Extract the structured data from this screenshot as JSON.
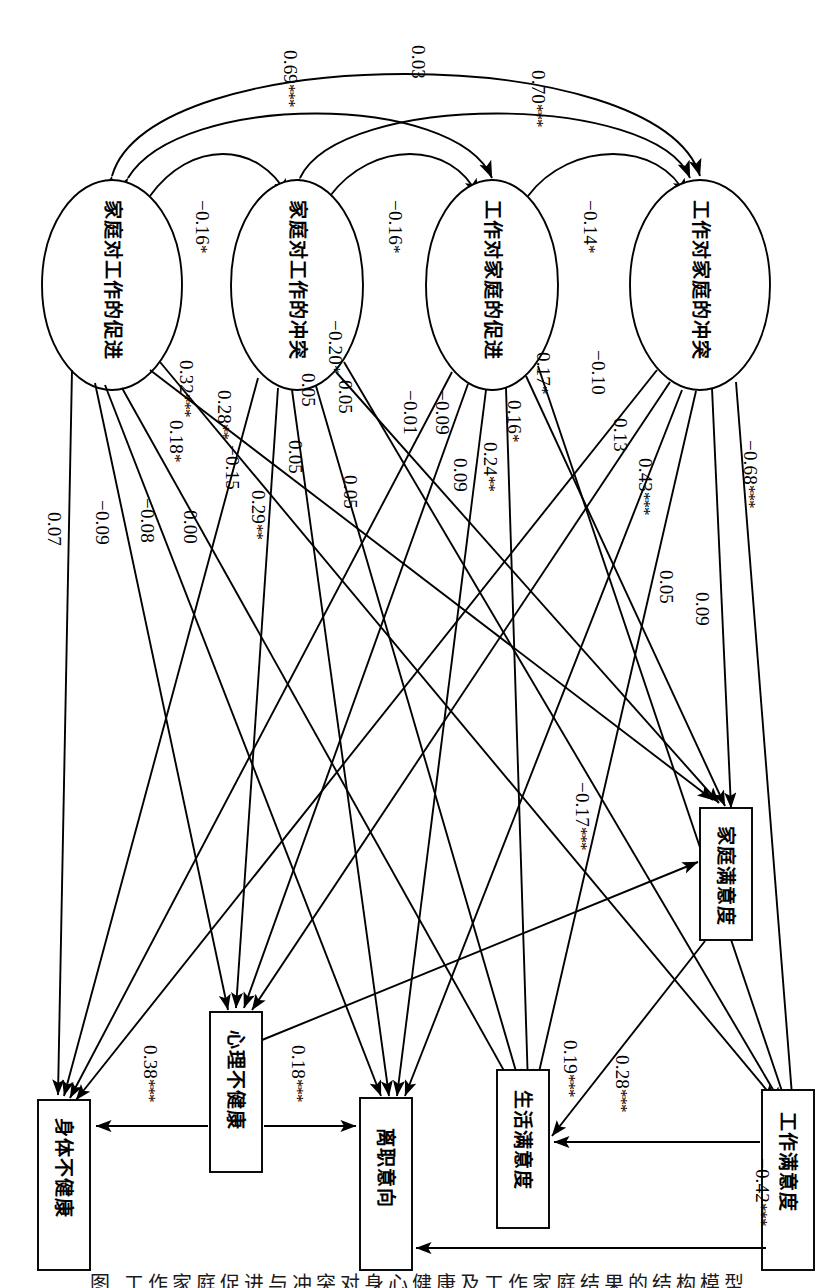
{
  "figure": {
    "type": "sem-path-diagram",
    "orientation": "rotated-90-ccw",
    "caption": "图 工作家庭促进与冲突对身心健康及工作家庭结果的结构模型"
  },
  "latent_nodes": [
    {
      "id": "fwf",
      "label": "家庭对工作的促进"
    },
    {
      "id": "fwc",
      "label": "家庭对工作的冲突"
    },
    {
      "id": "wff",
      "label": "工作对家庭的促进"
    },
    {
      "id": "wfc",
      "label": "工作对家庭的冲突"
    }
  ],
  "outcome_nodes": [
    {
      "id": "phys",
      "label": "身体不健康"
    },
    {
      "id": "psych",
      "label": "心理不健康"
    },
    {
      "id": "turnover",
      "label": "离职意向"
    },
    {
      "id": "lifesat",
      "label": "生活满意度"
    },
    {
      "id": "jobsat",
      "label": "工作满意度"
    },
    {
      "id": "famsat",
      "label": "家庭满意度"
    }
  ],
  "correlations": [
    {
      "from": "fwf",
      "to": "wfc",
      "value": "0.69",
      "stars": "***"
    },
    {
      "from": "fwc",
      "to": "wff",
      "value": "0.03",
      "stars": ""
    },
    {
      "from": "fwc",
      "to": "wfc",
      "value": "0.70",
      "stars": "***"
    },
    {
      "from": "fwf",
      "to": "fwc",
      "value": "−0.16",
      "stars": "*"
    },
    {
      "from": "fwc",
      "to": "wff",
      "value": "−0.16",
      "stars": "*"
    },
    {
      "from": "wff",
      "to": "wfc",
      "value": "−0.14",
      "stars": "*"
    }
  ],
  "paths": [
    {
      "from": "fwf",
      "to": "phys",
      "value": "0.07",
      "stars": ""
    },
    {
      "from": "fwf",
      "to": "psych",
      "value": "−0.09",
      "stars": ""
    },
    {
      "from": "fwf",
      "to": "turnover",
      "value": "−0.08",
      "stars": ""
    },
    {
      "from": "fwf",
      "to": "lifesat",
      "value": "0.18",
      "stars": "*"
    },
    {
      "from": "fwf",
      "to": "famsat",
      "value": "0.32",
      "stars": "***"
    },
    {
      "from": "fwf",
      "to": "jobsat",
      "value": "0.28",
      "stars": "**"
    },
    {
      "from": "fwc",
      "to": "phys",
      "value": "0.00",
      "stars": ""
    },
    {
      "from": "fwc",
      "to": "psych",
      "value": "0.29",
      "stars": "**"
    },
    {
      "from": "fwc",
      "to": "turnover",
      "value": "−0.15",
      "stars": ""
    },
    {
      "from": "fwc",
      "to": "lifesat",
      "value": "0.05",
      "stars": ""
    },
    {
      "from": "fwc",
      "to": "famsat",
      "value": "0.05",
      "stars": ""
    },
    {
      "from": "fwc",
      "to": "jobsat",
      "value": "−0.20",
      "stars": "*"
    },
    {
      "from": "wff",
      "to": "phys",
      "value": "0.05",
      "stars": ""
    },
    {
      "from": "wff",
      "to": "psych",
      "value": "0.05",
      "stars": ""
    },
    {
      "from": "wff",
      "to": "turnover",
      "value": "−0.01",
      "stars": ""
    },
    {
      "from": "wff",
      "to": "lifesat",
      "value": "−0.09",
      "stars": ""
    },
    {
      "from": "wff",
      "to": "famsat",
      "value": "0.09",
      "stars": ""
    },
    {
      "from": "wff",
      "to": "jobsat",
      "value": "0.24",
      "stars": "**"
    },
    {
      "from": "wff",
      "to": "jobsat2",
      "value": "0.17",
      "stars": "*"
    },
    {
      "from": "wff",
      "to": "lifesat2",
      "value": "0.16",
      "stars": "*"
    },
    {
      "from": "wfc",
      "to": "phys",
      "value": "−0.10",
      "stars": ""
    },
    {
      "from": "wfc",
      "to": "psych",
      "value": "0.13",
      "stars": ""
    },
    {
      "from": "wfc",
      "to": "turnover",
      "value": "0.43",
      "stars": "***"
    },
    {
      "from": "wfc",
      "to": "lifesat",
      "value": "0.05",
      "stars": ""
    },
    {
      "from": "wfc",
      "to": "famsat",
      "value": "0.09",
      "stars": ""
    },
    {
      "from": "wfc",
      "to": "jobsat",
      "value": "−0.68",
      "stars": "***"
    }
  ],
  "outcome_paths": [
    {
      "from": "psych",
      "to": "phys",
      "value": "0.38",
      "stars": "***"
    },
    {
      "from": "psych",
      "to": "turnover",
      "value": "0.18",
      "stars": "***"
    },
    {
      "from": "jobsat",
      "to": "lifesat",
      "value": "0.28",
      "stars": "***"
    },
    {
      "from": "jobsat",
      "to": "turnover",
      "value": "−0.42",
      "stars": "***"
    },
    {
      "from": "famsat",
      "to": "lifesat",
      "value": "0.19",
      "stars": "***"
    },
    {
      "from": "psych",
      "to": "famsat",
      "value": "−0.17",
      "stars": "***"
    }
  ]
}
